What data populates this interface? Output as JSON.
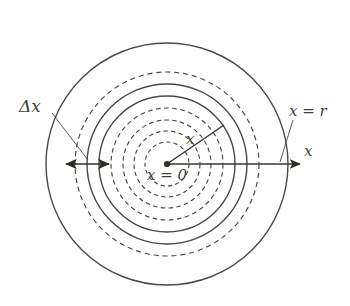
{
  "figure": {
    "background_color": "#ffffff",
    "stroke_color": "#4a4a42",
    "text_color": "#3f3f38",
    "center": {
      "x": 167,
      "y": 164
    },
    "labels": {
      "delta_x": "Δx",
      "x_equals_r": "x = r",
      "axis_x": "x",
      "radius_x": "x",
      "x_equals_zero": "x = 0"
    },
    "rings": [
      {
        "name": "ring-1",
        "radius": 22,
        "style": "dashed"
      },
      {
        "name": "ring-2",
        "radius": 33,
        "style": "dashed"
      },
      {
        "name": "ring-3",
        "radius": 44,
        "style": "dashed"
      },
      {
        "name": "ring-4",
        "radius": 56,
        "style": "dashed"
      },
      {
        "name": "ring-5",
        "radius": 68,
        "style": "solid"
      },
      {
        "name": "ring-6",
        "radius": 80,
        "style": "solid"
      },
      {
        "name": "ring-7",
        "radius": 92,
        "style": "dashed"
      },
      {
        "name": "ring-8",
        "radius": 121,
        "style": "solid"
      }
    ],
    "axis": {
      "name": "x-axis-arrow",
      "from": {
        "x": 167,
        "y": 164
      },
      "to": {
        "x": 300,
        "y": 164
      }
    },
    "radius_line": {
      "name": "radius-line",
      "from": {
        "x": 167,
        "y": 164
      },
      "to": {
        "x": 224,
        "y": 125
      }
    },
    "delta_x_dimension": {
      "name": "delta-x-dimension-arrow",
      "left": {
        "x": 66,
        "y": 164
      },
      "right": {
        "x": 109,
        "y": 164
      },
      "double_headed": true
    },
    "leader_lines": [
      {
        "name": "delta-x-leader",
        "from": {
          "x": 52,
          "y": 113
        },
        "to": {
          "x": 88,
          "y": 160
        }
      },
      {
        "name": "x-equals-r-leader",
        "from": {
          "x": 293,
          "y": 120
        },
        "to": {
          "x": 280,
          "y": 162
        }
      }
    ]
  }
}
